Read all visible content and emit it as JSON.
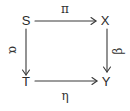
{
  "diagram": {
    "type": "commutative-square",
    "nodes": {
      "top_left": "S",
      "top_right": "X",
      "bottom_left": "T",
      "bottom_right": "Y"
    },
    "arrows": [
      {
        "from": "S",
        "to": "X",
        "label": "π"
      },
      {
        "from": "S",
        "to": "T",
        "label": "α"
      },
      {
        "from": "X",
        "to": "Y",
        "label": "β"
      },
      {
        "from": "T",
        "to": "Y",
        "label": "η"
      }
    ],
    "labels": {
      "top": "π",
      "left": "α",
      "right": "β",
      "bottom": "η"
    },
    "colors": {
      "stroke": "#3a3a3a",
      "background": "#ffffff"
    }
  }
}
